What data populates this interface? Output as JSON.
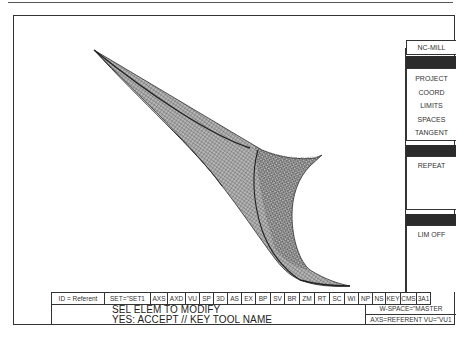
{
  "right_panel": {
    "title": "NC-MILL",
    "group1": [
      "PROJECT",
      "COORD",
      "LIMITS",
      "SPACES",
      "TANGENT"
    ],
    "group2": [
      "REPEAT"
    ],
    "group3": [
      "LIM OFF"
    ]
  },
  "status_bar": {
    "cells": [
      {
        "label": "ID = Referent",
        "w": 53
      },
      {
        "label": "SET=\"SET1",
        "w": 46
      },
      {
        "label": "AXS",
        "w": 17
      },
      {
        "label": "AXD",
        "w": 18
      },
      {
        "label": "VU",
        "w": 14
      },
      {
        "label": "SP",
        "w": 14
      },
      {
        "label": "3D",
        "w": 14
      },
      {
        "label": "AS",
        "w": 14
      },
      {
        "label": "EX",
        "w": 14
      },
      {
        "label": "BP",
        "w": 15
      },
      {
        "label": "SV",
        "w": 14
      },
      {
        "label": "BR",
        "w": 15
      },
      {
        "label": "ZM",
        "w": 15
      },
      {
        "label": "RT",
        "w": 15
      },
      {
        "label": "SC",
        "w": 15
      },
      {
        "label": "WI",
        "w": 14
      },
      {
        "label": "NP",
        "w": 14
      },
      {
        "label": "NS",
        "w": 13
      },
      {
        "label": "KEY",
        "w": 15
      },
      {
        "label": "CMS",
        "w": 16
      },
      {
        "label": "3A1",
        "w": 14
      }
    ]
  },
  "message": {
    "line1": "SEL ELEM TO MODIFY",
    "line2": "YES: ACCEPT // KEY TOOL NAME"
  },
  "workspace": {
    "w_space": "W-SPACE=\"MASTER",
    "axs_vu": "AXS=REFERENT VU=\"VU1"
  },
  "viewport": {
    "object": "wireframe-swept-surface",
    "line_color": "#3a3a3a"
  }
}
